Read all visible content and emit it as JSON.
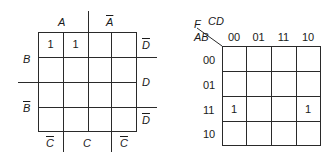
{
  "left_map": {
    "col_var_top": [
      "A",
      "A"
    ],
    "col_var_top_negated": [
      false,
      true
    ],
    "col_var_bottom": [
      "C",
      "C",
      "C"
    ],
    "col_var_bottom_negated": [
      true,
      false,
      true
    ],
    "row_var_left": [
      "B",
      "B"
    ],
    "row_var_left_negated": [
      false,
      true
    ],
    "row_var_right": [
      "D",
      "D",
      "D"
    ],
    "row_var_right_negated": [
      true,
      false,
      true
    ],
    "cells": [
      [
        "1",
        "1",
        "",
        ""
      ],
      [
        "",
        "",
        "",
        ""
      ],
      [
        "",
        "",
        "",
        ""
      ],
      [
        "",
        "",
        "",
        ""
      ]
    ]
  },
  "right_map": {
    "function_label": "F",
    "col_vars": "CD",
    "row_vars": "AB",
    "col_headers": [
      "00",
      "01",
      "11",
      "10"
    ],
    "row_headers": [
      "00",
      "01",
      "11",
      "10"
    ],
    "cells": [
      [
        "",
        "",
        "",
        ""
      ],
      [
        "",
        "",
        "",
        ""
      ],
      [
        "1",
        "",
        "",
        "1"
      ],
      [
        "",
        "",
        "",
        ""
      ]
    ]
  }
}
